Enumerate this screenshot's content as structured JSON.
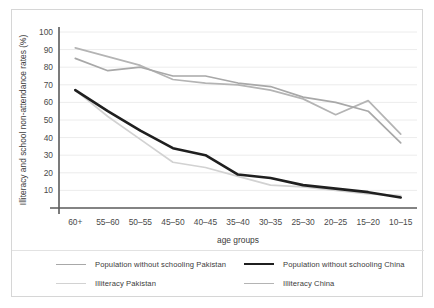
{
  "chart_data": {
    "type": "line",
    "title": "",
    "xlabel": "age groups",
    "ylabel": "Illiteracy and school non-attendance rates (%)",
    "categories": [
      "60+",
      "55–60",
      "50–55",
      "45–50",
      "40–45",
      "35–40",
      "30–35",
      "25–30",
      "20–25",
      "15–20",
      "10–15"
    ],
    "ylim": [
      0,
      100
    ],
    "yticks": [
      10,
      20,
      30,
      40,
      50,
      60,
      70,
      80,
      90,
      100
    ],
    "grid": true,
    "legend_position": "bottom",
    "series": [
      {
        "name": "Population without schooling Pakistan",
        "color": "#a8a8a8",
        "width": 1.7,
        "values": [
          85,
          78,
          80,
          75,
          75,
          71,
          69,
          63,
          60,
          55,
          37
        ]
      },
      {
        "name": "Population without schooling China",
        "color": "#1f1f1f",
        "width": 2.6,
        "values": [
          67,
          55,
          44,
          34,
          30,
          19,
          17,
          13,
          11,
          9,
          6
        ]
      },
      {
        "name": "Illiteracy Pakistan",
        "color": "#d2d2d2",
        "width": 1.7,
        "values": [
          67,
          52,
          39,
          26,
          23,
          18,
          13,
          12,
          10,
          8,
          7
        ]
      },
      {
        "name": "Illiteracy China",
        "color": "#b4b4b4",
        "width": 1.7,
        "values": [
          91,
          86,
          81,
          73,
          71,
          70,
          67,
          62,
          53,
          61,
          42
        ]
      }
    ],
    "legend_entries": [
      {
        "label": "Population without schooling Pakistan",
        "color": "#a8a8a8",
        "width": 1.7
      },
      {
        "label": "Illiteracy Pakistan",
        "color": "#d2d2d2",
        "width": 1.7
      },
      {
        "label": "Population without schooling China",
        "color": "#1f1f1f",
        "width": 2.6
      },
      {
        "label": "Illiteracy China",
        "color": "#b4b4b4",
        "width": 1.7
      }
    ]
  },
  "colors": {
    "axis": "#5a5a5a",
    "grid": "#ececec",
    "border": "#d6d6d6",
    "text": "#3b3b3b"
  }
}
